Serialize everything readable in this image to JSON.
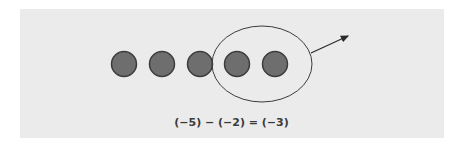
{
  "diagram": {
    "equation": "(−5) − (−2) = (−3)",
    "counters": {
      "count": 5,
      "fill": "#6e6e6e",
      "stroke": "#3c3c3c",
      "centers_x": [
        124,
        162,
        200,
        237,
        275
      ],
      "center_y": 64,
      "radius": 12.5
    },
    "grouping_ellipse": {
      "cx": 262,
      "cy": 64,
      "rx": 50,
      "ry": 38,
      "stroke": "#3c3c3c",
      "encloses_counters": 2
    },
    "removal_arrow": {
      "from": [
        311,
        53
      ],
      "to": [
        348,
        36
      ]
    },
    "background": "#ebebeb"
  }
}
